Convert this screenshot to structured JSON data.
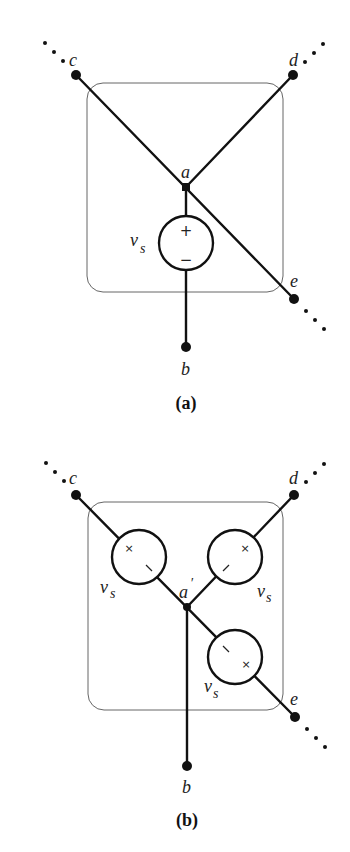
{
  "diagram_a": {
    "caption": "(a)",
    "nodes": {
      "a": "a",
      "b": "b",
      "c": "c",
      "d": "d",
      "e": "e"
    },
    "source": {
      "label_main": "v",
      "label_sub": "s",
      "plus": "+",
      "minus": "−"
    }
  },
  "diagram_b": {
    "caption": "(b)",
    "nodes": {
      "a": "a",
      "a_prime": "′",
      "b": "b",
      "c": "c",
      "d": "d",
      "e": "e"
    },
    "sources": [
      {
        "position": "upper-left",
        "label_main": "v",
        "label_sub": "s",
        "mark_outer": "×",
        "mark_inner": "\\"
      },
      {
        "position": "upper-right",
        "label_main": "v",
        "label_sub": "s",
        "mark_outer": "×",
        "mark_inner": "/"
      },
      {
        "position": "lower-right",
        "label_main": "v",
        "label_sub": "s",
        "mark_outer": "×",
        "mark_inner": "\\"
      }
    ]
  },
  "colors": {
    "wire": "#111111",
    "box": "#666666",
    "background": "#ffffff"
  }
}
